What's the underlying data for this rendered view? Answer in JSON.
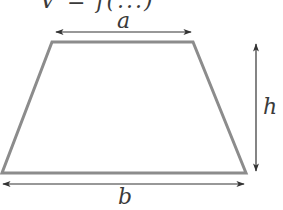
{
  "figure": {
    "type": "trapezoid-dimension-diagram",
    "cutoff_header_text": "V = f(...)",
    "labels": {
      "top_side": "a",
      "bottom_side": "b",
      "height": "h"
    },
    "colors": {
      "shape_stroke": "#8c8c8c",
      "arrow": "#333333",
      "label": "#3a3a3a",
      "background": "#ffffff"
    }
  }
}
